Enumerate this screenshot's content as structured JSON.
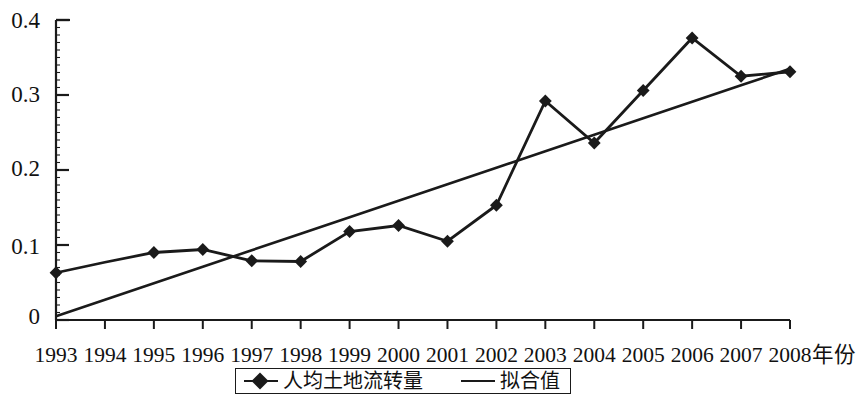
{
  "chart_data": {
    "type": "line",
    "title": "",
    "xlabel": "年份",
    "ylabel": "",
    "xlim": [
      1993,
      2008
    ],
    "ylim": [
      0,
      0.4
    ],
    "grid": false,
    "legend_position": "bottom",
    "categories": [
      "1993",
      "1994",
      "1995",
      "1996",
      "1997",
      "1998",
      "1999",
      "2000",
      "2001",
      "2002",
      "2003",
      "2004",
      "2005",
      "2006",
      "2007",
      "2008"
    ],
    "x": [
      1993,
      1994,
      1995,
      1996,
      1997,
      1998,
      1999,
      2000,
      2001,
      2002,
      2003,
      2004,
      2005,
      2006,
      2007,
      2008
    ],
    "ytick_labels": [
      "0.4",
      "0.3",
      "0.2",
      "0.1",
      "0"
    ],
    "ytick_values": [
      0.4,
      0.3,
      0.2,
      0.1,
      0
    ],
    "series": [
      {
        "name": "人均土地流转量",
        "marker": "diamond",
        "color": "#1a1a1a",
        "values": [
          0.063,
          0.077,
          0.09,
          0.094,
          0.079,
          0.078,
          0.118,
          0.126,
          0.105,
          0.153,
          0.292,
          0.236,
          0.306,
          0.376,
          0.325,
          0.331
        ],
        "marker_at": [
          1993,
          1995,
          1996,
          1997,
          1998,
          1999,
          2000,
          2001,
          2002,
          2003,
          2004,
          2005,
          2006,
          2007,
          2008
        ]
      },
      {
        "name": "拟合值",
        "marker": "none",
        "color": "#1a1a1a",
        "values": [
          0.005,
          0.027,
          0.049,
          0.071,
          0.093,
          0.115,
          0.137,
          0.159,
          0.181,
          0.203,
          0.225,
          0.247,
          0.269,
          0.291,
          0.313,
          0.335
        ]
      }
    ]
  },
  "legend": {
    "entries": [
      {
        "label": "人均土地流转量",
        "symbol": "line-with-diamond-marker"
      },
      {
        "label": "拟合值",
        "symbol": "plain-line"
      }
    ]
  }
}
